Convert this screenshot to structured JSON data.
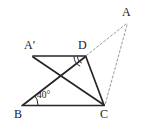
{
  "figure": {
    "kind": "geometry-diagram",
    "width": 146,
    "height": 134,
    "background": "#ffffff",
    "stroke_solid": "#262626",
    "stroke_dashed": "#9a9a9a",
    "label_color": "#1a1a1a",
    "points": {
      "A": {
        "label": "A",
        "x": 127,
        "y": 22
      },
      "Aprime": {
        "label": "A′",
        "x": 33,
        "y": 56
      },
      "D": {
        "label": "D",
        "x": 85,
        "y": 56
      },
      "B": {
        "label": "B",
        "x": 22,
        "y": 106
      },
      "C": {
        "label": "C",
        "x": 104,
        "y": 106
      }
    },
    "segments": [
      {
        "name": "A-prime-to-D",
        "from": "Aprime",
        "to": "D",
        "style": "solid"
      },
      {
        "name": "A-prime-to-C",
        "from": "Aprime",
        "to": "C",
        "style": "solid"
      },
      {
        "name": "D-to-C",
        "from": "D",
        "to": "C",
        "style": "solid"
      },
      {
        "name": "B-to-D",
        "from": "B",
        "to": "D",
        "style": "solid"
      },
      {
        "name": "B-to-C",
        "from": "B",
        "to": "C",
        "style": "solid"
      },
      {
        "name": "A-to-D",
        "from": "A",
        "to": "D",
        "style": "dashed"
      },
      {
        "name": "A-to-C",
        "from": "A",
        "to": "C",
        "style": "dashed"
      },
      {
        "name": "D-to-B",
        "from": "D",
        "to": "B",
        "style": "dashed"
      }
    ],
    "angles": [
      {
        "name": "angle-at-B",
        "vertex": "B",
        "label": "40°",
        "value": 40,
        "unit": "degrees",
        "marked": true
      },
      {
        "name": "angle-at-D",
        "vertex": "D",
        "label": "",
        "marked": true,
        "marker": "double-arc"
      }
    ]
  }
}
